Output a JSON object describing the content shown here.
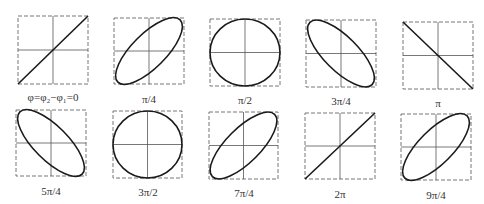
{
  "colors": {
    "curve": "#1a1a1a",
    "axis": "#555555",
    "frame": "#777777",
    "background": "#ffffff"
  },
  "panels": [
    {
      "label": "φ=φ₂−φ₁=0",
      "phase": "0",
      "shape": "line-pos",
      "x": 17,
      "y": 15
    },
    {
      "label": "π/4",
      "phase": "π/4",
      "shape": "ellipse-pos",
      "x": 113,
      "y": 17
    },
    {
      "label": "π/2",
      "phase": "π/2",
      "shape": "circle",
      "x": 209,
      "y": 18
    },
    {
      "label": "3π/4",
      "phase": "3π/4",
      "shape": "ellipse-neg",
      "x": 305,
      "y": 19
    },
    {
      "label": "π",
      "phase": "π",
      "shape": "line-neg",
      "x": 402,
      "y": 21
    },
    {
      "label": "5π/4",
      "phase": "5π/4",
      "shape": "ellipse-neg",
      "x": 15,
      "y": 109
    },
    {
      "label": "3π/2",
      "phase": "3π/2",
      "shape": "circle",
      "x": 112,
      "y": 110
    },
    {
      "label": "7π/4",
      "phase": "7π/4",
      "shape": "ellipse-pos",
      "x": 208,
      "y": 111
    },
    {
      "label": "2π",
      "phase": "2π",
      "shape": "line-pos",
      "x": 304,
      "y": 112
    },
    {
      "label": "9π/4",
      "phase": "9π/4",
      "shape": "ellipse-pos",
      "x": 400,
      "y": 113
    }
  ]
}
